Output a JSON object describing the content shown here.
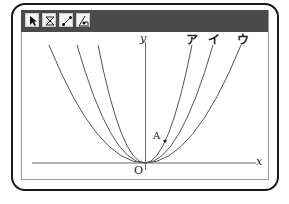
{
  "toolbar": {
    "tools": [
      {
        "name": "select-tool",
        "icon": "arrow-pointer-icon"
      },
      {
        "name": "intersect-tool",
        "icon": "cross-point-icon"
      },
      {
        "name": "segment-tool",
        "icon": "line-segment-icon"
      },
      {
        "name": "angle-tool",
        "icon": "angle-icon"
      }
    ]
  },
  "graph": {
    "x_axis_label": "x",
    "y_axis_label": "y",
    "origin_label": "O",
    "point_label": "A",
    "curve_labels": [
      "ア",
      "イ",
      "ウ"
    ]
  },
  "colors": {
    "toolbar": "#4a4a4a",
    "frame": "#1a1a1a",
    "curve": "#555555",
    "axis": "#666666"
  }
}
